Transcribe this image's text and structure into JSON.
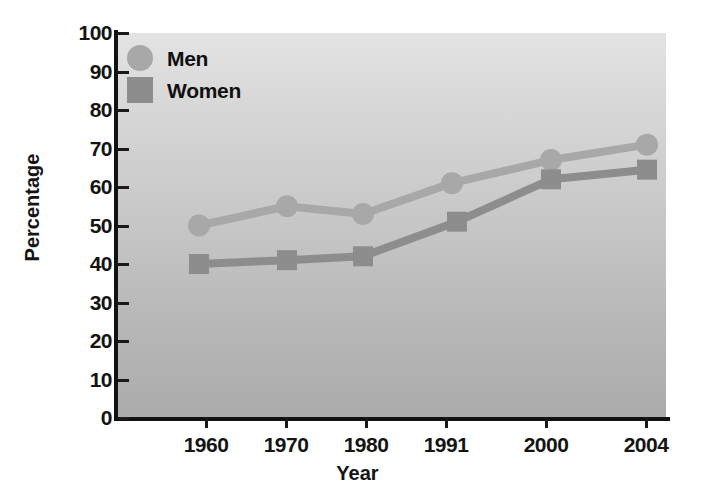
{
  "chart_data": {
    "type": "line",
    "title": "",
    "xlabel": "Year",
    "ylabel": "Percentage",
    "categories": [
      "1960",
      "1970",
      "1980",
      "1991",
      "2000",
      "2004"
    ],
    "x_tick_labels": [
      "1960",
      "1970",
      "1980",
      "1991",
      "2000",
      "2004"
    ],
    "y_tick_labels": [
      "100",
      "90",
      "80",
      "70",
      "60",
      "50",
      "40",
      "30",
      "20",
      "10",
      "0"
    ],
    "ylim": [
      0,
      100
    ],
    "y_step": 10,
    "grid": false,
    "legend_position": "top-left",
    "series": [
      {
        "name": "Men",
        "marker": "circle",
        "color": "#a8a8a8",
        "values": [
          50,
          55,
          53,
          61,
          67,
          71
        ]
      },
      {
        "name": "Women",
        "marker": "square",
        "color": "#8d8d8d",
        "values": [
          40,
          41,
          42,
          51,
          62,
          64.5
        ]
      }
    ]
  },
  "legend": {
    "items": [
      {
        "label": "Men",
        "marker": "circle",
        "color": "#a8a8a8"
      },
      {
        "label": "Women",
        "marker": "square",
        "color": "#8d8d8d"
      }
    ]
  },
  "axes": {
    "x_title": "Year",
    "y_title": "Percentage"
  },
  "colors": {
    "men": "#a8a8a8",
    "women": "#8d8d8d",
    "axis": "#121212",
    "plot_bg_top": "#e3e3e3",
    "plot_bg_bottom": "#ababab",
    "text": "#141414"
  }
}
